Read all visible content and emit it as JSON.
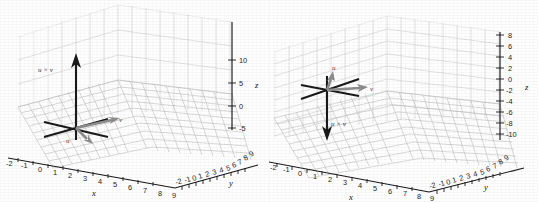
{
  "figure": {
    "background_color": "#ffffff",
    "grid_color": "#c9c9c9",
    "axis_color": "#1a1a1a",
    "vector_dark_color": "#1a1a1a",
    "vector_gray_color": "#8d8d8d"
  },
  "panels": [
    {
      "id": "left",
      "axis_labels": {
        "x": "x",
        "y": "y",
        "z": "z"
      },
      "x_ticks": [
        "-2",
        "-1",
        "0",
        "1",
        "2",
        "3",
        "4",
        "5",
        "6",
        "7",
        "8",
        "9"
      ],
      "y_ticks": [
        "-2",
        "-1",
        "0",
        "1",
        "2",
        "3",
        "4",
        "5",
        "6",
        "7",
        "8",
        "9"
      ],
      "z_ticks": [
        "10",
        "5",
        "0",
        "-5"
      ],
      "vectors": [
        {
          "name": "u",
          "label": "u",
          "color": "#8d8d8d",
          "direction": "down-left-front"
        },
        {
          "name": "v",
          "label": "v",
          "color": "#8d8d8d",
          "direction": "right-back"
        },
        {
          "name": "u-cross-v",
          "label": "u × v",
          "color": "#1a1a1a",
          "direction": "up"
        }
      ]
    },
    {
      "id": "right",
      "axis_labels": {
        "x": "x",
        "y": "y",
        "z": "z"
      },
      "x_ticks": [
        "-2",
        "-1",
        "0",
        "1",
        "2",
        "3",
        "4",
        "5",
        "6",
        "7",
        "8",
        "9"
      ],
      "y_ticks": [
        "-2",
        "-1",
        "0",
        "1",
        "2",
        "3",
        "4",
        "5",
        "6",
        "7",
        "8",
        "9"
      ],
      "z_ticks": [
        "8",
        "6",
        "4",
        "2",
        "0",
        "-2",
        "-4",
        "-6",
        "-8",
        "-10"
      ],
      "vectors": [
        {
          "name": "u",
          "label": "u",
          "color": "#8d8d8d",
          "direction": "up-back"
        },
        {
          "name": "v",
          "label": "v",
          "color": "#8d8d8d",
          "direction": "right"
        },
        {
          "name": "u-cross-v",
          "label": "u × v",
          "color": "#1a1a1a",
          "direction": "down"
        }
      ]
    }
  ]
}
